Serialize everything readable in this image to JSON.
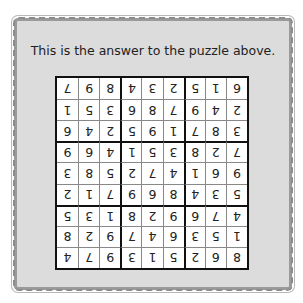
{
  "caption": "This is the answer to the puzzle above.",
  "grid_orientation": "rotated 180 degrees (upside down)",
  "solution": [
    [
      "8",
      "6",
      "2",
      "5",
      "1",
      "3",
      "9",
      "7",
      "4"
    ],
    [
      "1",
      "5",
      "3",
      "6",
      "4",
      "7",
      "9",
      "2",
      "8"
    ],
    [
      "4",
      "7",
      "6",
      "9",
      "2",
      "8",
      "1",
      "3",
      "5"
    ],
    [
      "5",
      "3",
      "4",
      "8",
      "6",
      "9",
      "7",
      "1",
      "2"
    ],
    [
      "9",
      "6",
      "1",
      "4",
      "7",
      "2",
      "5",
      "8",
      "3"
    ],
    [
      "7",
      "2",
      "8",
      "3",
      "5",
      "1",
      "4",
      "6",
      "9"
    ],
    [
      "3",
      "8",
      "7",
      "1",
      "9",
      "5",
      "2",
      "4",
      "6"
    ],
    [
      "2",
      "4",
      "9",
      "7",
      "8",
      "6",
      "3",
      "5",
      "1"
    ],
    [
      "6",
      "1",
      "5",
      "2",
      "3",
      "4",
      "8",
      "9",
      "7"
    ]
  ],
  "colors": {
    "card_background": "#dcdcdc",
    "border": "#9a9a9a",
    "grid_line": "#111111",
    "text": "#222222"
  }
}
